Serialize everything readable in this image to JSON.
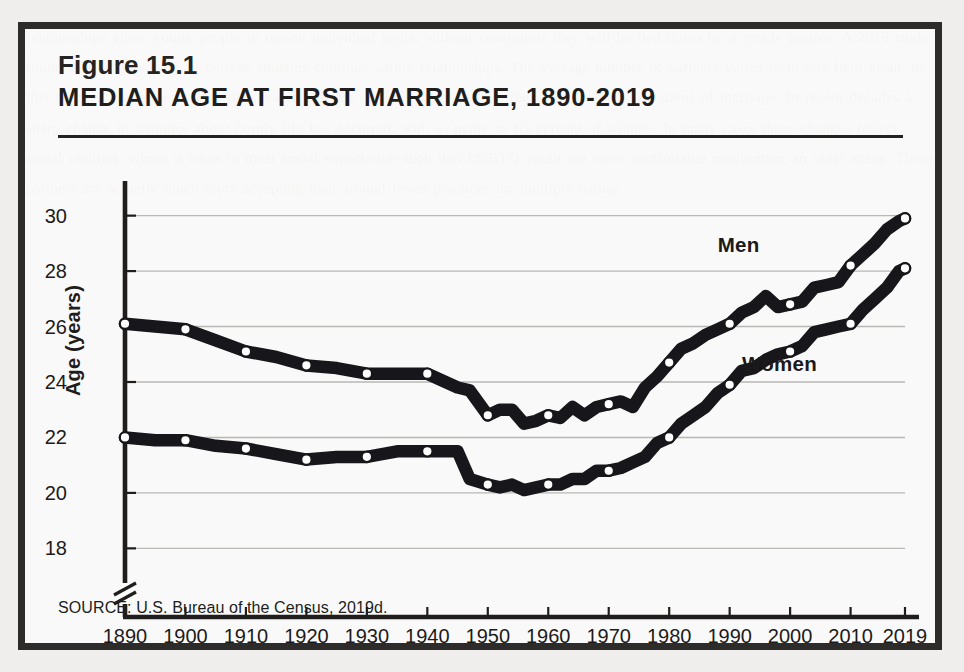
{
  "figure": {
    "number": "Figure 15.1",
    "title": "MEDIAN AGE AT FIRST MARRIAGE, 1890-2019",
    "source": "SOURCE: U.S. Bureau of the Census, 2019d."
  },
  "colors": {
    "ink": "#201e1d",
    "frame": "#2e2c2b",
    "line": "#17161a",
    "gridline": "#b9b7b4",
    "marker_fill": "#ffffff",
    "page_background": "#efeeec"
  },
  "chart_data": {
    "type": "line",
    "title": "MEDIAN AGE AT FIRST MARRIAGE, 1890-2019",
    "xlabel": "",
    "ylabel": "Age (years)",
    "ylim": [
      17.2,
      30.6
    ],
    "xlim": [
      1890,
      2019
    ],
    "grid": true,
    "legend_position": "inline-annotation",
    "y_ticks": [
      18,
      20,
      22,
      24,
      26,
      28,
      30
    ],
    "x_ticks": [
      1890,
      1900,
      1910,
      1920,
      1930,
      1940,
      1950,
      1960,
      1970,
      1980,
      1990,
      2000,
      2010,
      2019
    ],
    "axis_break": true,
    "marker_years": [
      1890,
      1900,
      1910,
      1920,
      1930,
      1940,
      1950,
      1960,
      1970,
      1980,
      1990,
      2000,
      2010,
      2019
    ],
    "x": [
      1890,
      1895,
      1900,
      1905,
      1910,
      1915,
      1920,
      1925,
      1930,
      1935,
      1940,
      1945,
      1947,
      1950,
      1952,
      1954,
      1956,
      1958,
      1960,
      1962,
      1964,
      1966,
      1968,
      1970,
      1972,
      1974,
      1976,
      1978,
      1980,
      1982,
      1984,
      1986,
      1988,
      1990,
      1992,
      1994,
      1996,
      1998,
      2000,
      2002,
      2004,
      2006,
      2008,
      2010,
      2012,
      2014,
      2016,
      2018,
      2019
    ],
    "series": [
      {
        "name": "Men",
        "values": [
          26.1,
          26.0,
          25.9,
          25.5,
          25.1,
          24.9,
          24.6,
          24.5,
          24.3,
          24.3,
          24.3,
          23.8,
          23.7,
          22.8,
          23.0,
          23.0,
          22.5,
          22.6,
          22.8,
          22.7,
          23.1,
          22.8,
          23.1,
          23.2,
          23.3,
          23.1,
          23.8,
          24.2,
          24.7,
          25.2,
          25.4,
          25.7,
          25.9,
          26.1,
          26.5,
          26.7,
          27.1,
          26.7,
          26.8,
          26.9,
          27.4,
          27.5,
          27.6,
          28.2,
          28.6,
          29.0,
          29.5,
          29.8,
          29.9
        ],
        "label_year": 1992,
        "label_value": 28.9
      },
      {
        "name": "Women",
        "values": [
          22.0,
          21.9,
          21.9,
          21.7,
          21.6,
          21.4,
          21.2,
          21.3,
          21.3,
          21.5,
          21.5,
          21.5,
          20.5,
          20.3,
          20.2,
          20.3,
          20.1,
          20.2,
          20.3,
          20.3,
          20.5,
          20.5,
          20.8,
          20.8,
          20.9,
          21.1,
          21.3,
          21.8,
          22.0,
          22.5,
          22.8,
          23.1,
          23.6,
          23.9,
          24.4,
          24.5,
          24.8,
          25.0,
          25.1,
          25.3,
          25.8,
          25.9,
          26.0,
          26.1,
          26.6,
          27.0,
          27.4,
          28.0,
          28.1
        ],
        "label_year": 1996,
        "label_value": 24.6
      }
    ]
  },
  "bleed_text": "relationships allow young people to reason individual goals, without constraints they will be tied down by a steady partner. A 2019 study found that fully half of all college students continue dating relationships. The average number of partners varies from one field group to this country. More men rather than fewer had less obvious pattern where they were couples the status of marriage. In recent decades a sharp change in attitudes about family life has occurred, with as many as 65 percent of women. In many cases these changes reflect social realities, whom it takes to meet social expectation such that LGBTQ youth are more comfortable confronting an older scene. These partners are actually much more accepting than around fewer practices for multiple dating."
}
